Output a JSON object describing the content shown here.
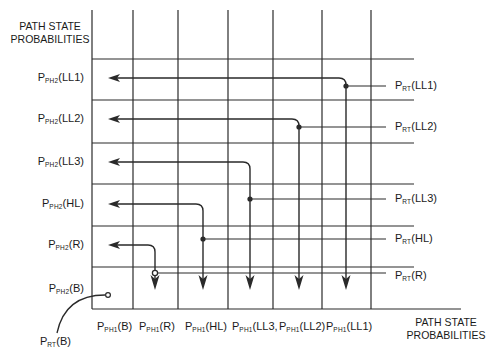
{
  "colors": {
    "line": "#2a2a2a",
    "background": "#ffffff",
    "text": "#1a1a1a"
  },
  "axis_titles": {
    "y": [
      "PATH STATE",
      "PROBABILITIES"
    ],
    "x": [
      "PATH STATE",
      "PROBABILITIES"
    ]
  },
  "grid": {
    "vertical_x": [
      92,
      133,
      178,
      228,
      273,
      322,
      371
    ],
    "vertical_top": 10,
    "vertical_bottom": 309,
    "horizontal_y": [
      59,
      100,
      143,
      184,
      226,
      267
    ],
    "horizontal_right": 414,
    "baseline_y": 309,
    "baseline_right": 461
  },
  "row_labels": [
    {
      "main": "P",
      "sub": "PH2",
      "arg": "(LL1)",
      "y": 78
    },
    {
      "main": "P",
      "sub": "PH2",
      "arg": "(LL2)",
      "y": 119
    },
    {
      "main": "P",
      "sub": "PH2",
      "arg": "(LL3)",
      "y": 162
    },
    {
      "main": "P",
      "sub": "PH2",
      "arg": "(HL)",
      "y": 204
    },
    {
      "main": "P",
      "sub": "PH2",
      "arg": "(R)",
      "y": 245
    },
    {
      "main": "P",
      "sub": "PH2",
      "arg": "(B)",
      "y": 289
    }
  ],
  "column_labels": [
    {
      "main": "P",
      "sub": "PH1",
      "arg": "(B)",
      "x": 97
    },
    {
      "main": "P",
      "sub": "PH1",
      "arg": "(R)",
      "x": 139
    },
    {
      "main": "P",
      "sub": "PH1",
      "arg": "(HL)",
      "x": 185
    },
    {
      "main": "P",
      "sub": "PH1",
      "arg": "(LL3,",
      "x": 232
    },
    {
      "main": "P",
      "sub": "PH1",
      "arg": "(LL2)",
      "x": 279
    },
    {
      "main": "P",
      "sub": "PH1",
      "arg": "(LL1)",
      "x": 326
    }
  ],
  "source_labels": [
    {
      "main": "P",
      "sub": "RT",
      "arg": "(LL1)",
      "y": 86
    },
    {
      "main": "P",
      "sub": "RT",
      "arg": "(LL2)",
      "y": 127
    },
    {
      "main": "P",
      "sub": "RT",
      "arg": "(LL3)",
      "y": 199
    },
    {
      "main": "P",
      "sub": "RT",
      "arg": "(HL)",
      "y": 239
    },
    {
      "main": "P",
      "sub": "RT",
      "arg": "(R)",
      "y": 276
    }
  ],
  "rt_b_label": {
    "main": "P",
    "sub": "RT",
    "arg": "(B)"
  },
  "paths": [
    {
      "name": "LL1",
      "source_y": 86,
      "node_x": 346,
      "row_y": 78,
      "arrow_end_y": 290,
      "node": "filled"
    },
    {
      "name": "LL2",
      "source_y": 127,
      "node_x": 299,
      "row_y": 119,
      "arrow_end_y": 290,
      "node": "filled"
    },
    {
      "name": "LL3",
      "source_y": 199,
      "node_x": 250,
      "row_y": 162,
      "arrow_end_y": 290,
      "node": "filled"
    },
    {
      "name": "HL",
      "source_y": 239,
      "node_x": 203,
      "row_y": 204,
      "arrow_end_y": 290,
      "node": "filled"
    },
    {
      "name": "R",
      "source_y": 273,
      "node_x": 155,
      "row_y": 245,
      "arrow_end_y": 290,
      "node": "hollow"
    }
  ],
  "row_arrow_tip_x": 108,
  "source_line_right_x": 386,
  "rt_b": {
    "start": [
      57,
      333
    ],
    "end": [
      108,
      295
    ]
  }
}
